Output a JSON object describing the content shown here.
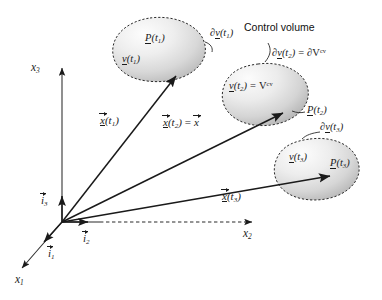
{
  "figure": {
    "type": "continuum-mechanics-diagram",
    "background_color": "#ffffff",
    "ink_color": "#1a1a1a"
  },
  "axes": {
    "x1": "x",
    "x1_sub": "1",
    "x2": "x",
    "x2_sub": "2",
    "x3": "x",
    "x3_sub": "3"
  },
  "basis": {
    "i1": "i",
    "i1_sub": "1",
    "i2": "i",
    "i2_sub": "2",
    "i3": "i",
    "i3_sub": "3"
  },
  "position_vectors": {
    "t1": {
      "symbol": "x",
      "arg": "(t",
      "sub": "1",
      "close": ")"
    },
    "t2": {
      "symbol": "x",
      "arg": "(t",
      "sub": "2",
      "close": ")",
      "equals": "=",
      "rhs": "x"
    },
    "t3": {
      "symbol": "x",
      "arg": "(t",
      "sub": "3",
      "close": ")"
    }
  },
  "blobs": [
    {
      "id": "blob-t1",
      "particle": {
        "symbol": "P",
        "arg": "(t",
        "sub": "1",
        "close": ")"
      },
      "volume": {
        "symbol": "v",
        "arg": "(t",
        "sub": "1",
        "close": ")"
      },
      "boundary": {
        "del": "∂",
        "symbol": "v",
        "arg": "(t",
        "sub": "1",
        "close": ")"
      }
    },
    {
      "id": "blob-t2",
      "particle": {
        "symbol": "P",
        "arg": "(t",
        "sub": "2",
        "close": ")"
      },
      "volume": {
        "symbol": "v",
        "arg": "(t",
        "sub": "2",
        "close": ")",
        "equals": "=",
        "rhs": "V",
        "rhs_sup": "cv"
      },
      "boundary": {
        "del": "∂",
        "symbol": "v",
        "arg": "(t",
        "sub": "2",
        "close": ")",
        "equals": "=",
        "rhs_del": "∂",
        "rhs": "V",
        "rhs_sup": "cv"
      }
    },
    {
      "id": "blob-t3",
      "particle": {
        "symbol": "P",
        "arg": "(t",
        "sub": "3",
        "close": ")"
      },
      "volume": {
        "symbol": "v",
        "arg": "(t",
        "sub": "3",
        "close": ")"
      },
      "boundary": {
        "del": "∂",
        "symbol": "v",
        "arg": "(t",
        "sub": "3",
        "close": ")"
      }
    }
  ],
  "annotations": {
    "control_volume": "Control volume"
  }
}
